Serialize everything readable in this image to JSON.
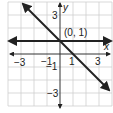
{
  "graph": {
    "x_axis_label": "x",
    "y_axis_label": "y",
    "point_label": "(0, 1)",
    "x_ticks": [
      "−3",
      "−1",
      "1",
      "3"
    ],
    "y_ticks": [
      "3",
      "−1",
      "−3"
    ],
    "lines": [
      {
        "name": "horizontal line",
        "equation": "y = 1"
      },
      {
        "name": "diagonal line",
        "equation": "y = -x + 1"
      }
    ],
    "colors": {
      "grid": "#cfcfcf",
      "axis": "#333333",
      "line": "#222222"
    }
  }
}
